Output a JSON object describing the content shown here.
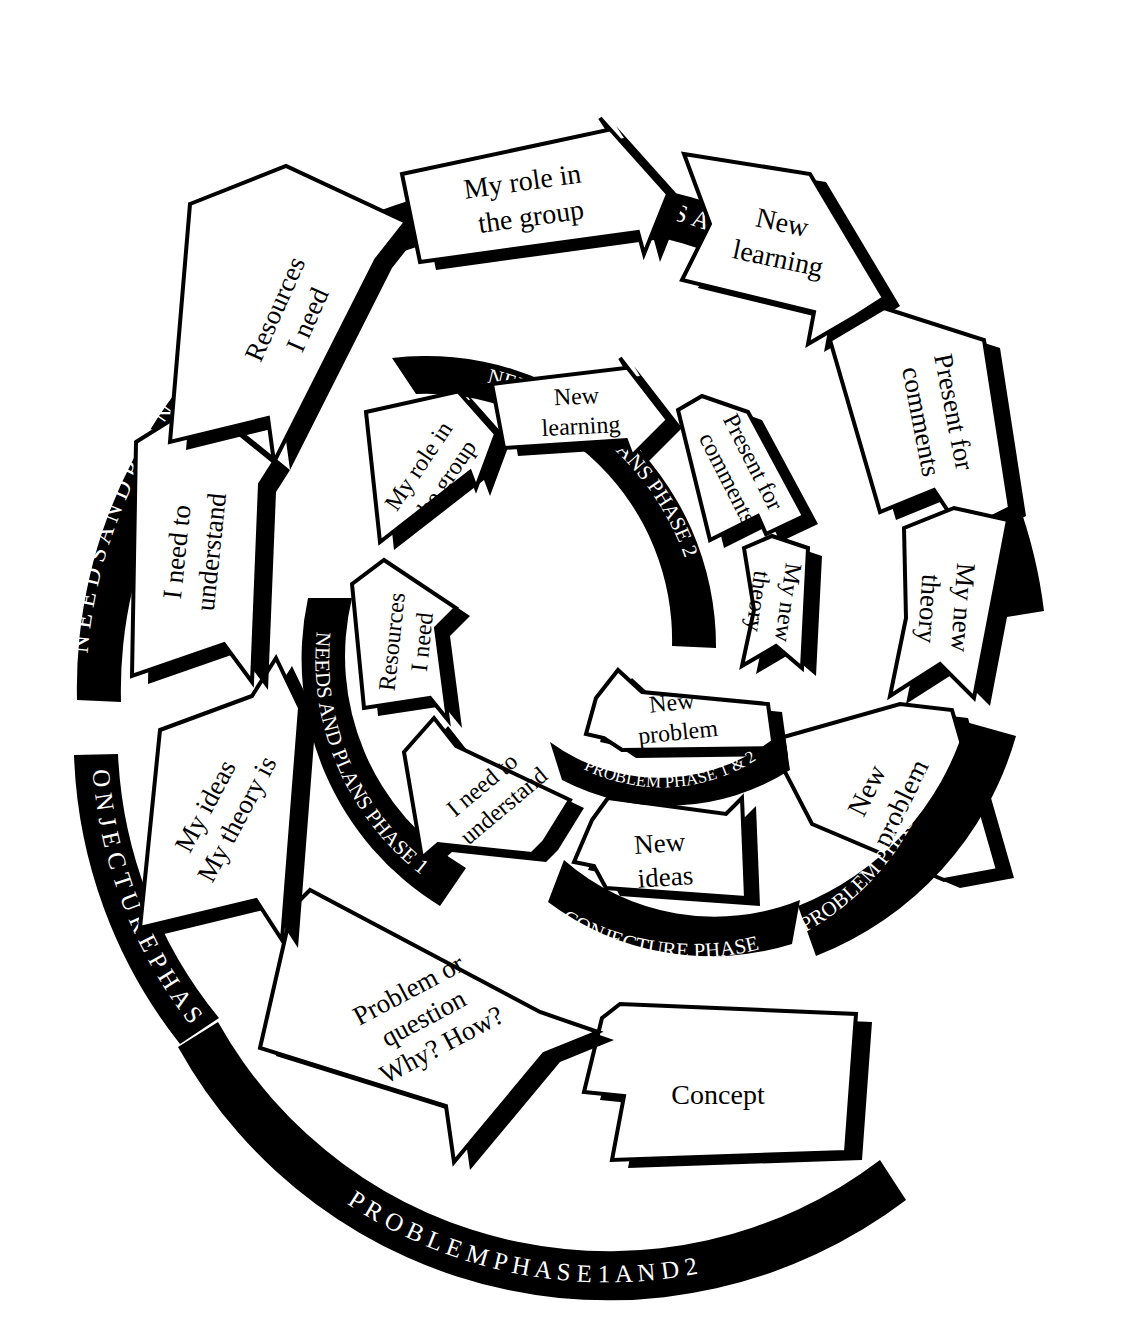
{
  "diagram": {
    "colors": {
      "ink": "#000000",
      "paper": "#ffffff",
      "band_text": "#ffffff"
    },
    "phase_bands": {
      "needs_phase_1": "N E E D S   A N D   P L A N S   P H A S E   1",
      "needs_phase_2": "N E E D S   A N D   P L A N S   P H A S E   2",
      "needs_phase_1_inner": "NEEDS AND PLANS PHASE 1",
      "needs_phase_2_inner": "NEEDS AND PLANS PHASE 2",
      "problem_phase_outer": "P R O B L E M   P H A S E   1   A N D   2",
      "problem_phase_mid": "PROBLEM PHASE 1 & 2",
      "problem_phase_inner": "PROBLEM PHASE 1 & 2",
      "conjecture_phase_outer": "C O N J E C T U R E   P H A S E",
      "conjecture_phase_mid": "CONJECTURE PHASE"
    },
    "outer_ring": {
      "name": "outer-spiral-ring",
      "steps": [
        {
          "id": "concept",
          "label": "Concept",
          "lines": [
            "Concept"
          ]
        },
        {
          "id": "problem-question",
          "label": "Problem or question Why? How?",
          "lines": [
            "Problem or",
            "question",
            "Why? How?"
          ]
        },
        {
          "id": "my-ideas-theory",
          "label": "My ideas My theory is",
          "lines": [
            "My ideas",
            "My theory is"
          ]
        },
        {
          "id": "i-need-understand",
          "label": "I need to understand",
          "lines": [
            "I need to",
            "understand"
          ]
        },
        {
          "id": "resources-i-need",
          "label": "Resources I need",
          "lines": [
            "Resources",
            "I need"
          ]
        },
        {
          "id": "my-role-group",
          "label": "My role in the group",
          "lines": [
            "My role in",
            "the group"
          ]
        },
        {
          "id": "new-learning",
          "label": "New learning",
          "lines": [
            "New",
            "learning"
          ]
        },
        {
          "id": "present-comments",
          "label": "Present for comments",
          "lines": [
            "Present for",
            "comments"
          ]
        },
        {
          "id": "my-new-theory",
          "label": "My new theory",
          "lines": [
            "My new",
            "theory"
          ]
        },
        {
          "id": "new-problem",
          "label": "New problem",
          "lines": [
            "New",
            "problem"
          ]
        }
      ]
    },
    "middle_ring": {
      "name": "middle-spiral-ring",
      "steps": [
        {
          "id": "new-ideas",
          "label": "New ideas",
          "lines": [
            "New",
            "ideas"
          ]
        },
        {
          "id": "i-need-understand",
          "label": "I need to understand",
          "lines": [
            "I need to",
            "understand"
          ]
        },
        {
          "id": "resources-i-need",
          "label": "Resources I need",
          "lines": [
            "Resources",
            "I need"
          ]
        },
        {
          "id": "my-role-group",
          "label": "My role in the group",
          "lines": [
            "My role in",
            "the group"
          ]
        },
        {
          "id": "new-learning",
          "label": "New learning",
          "lines": [
            "New",
            "learning"
          ]
        },
        {
          "id": "present-comments",
          "label": "Present for comments",
          "lines": [
            "Present for",
            "comments"
          ]
        },
        {
          "id": "my-new-theory",
          "label": "My new theory",
          "lines": [
            "My new",
            "theory"
          ]
        },
        {
          "id": "new-problem",
          "label": "New problem",
          "lines": [
            "New",
            "problem"
          ]
        }
      ]
    }
  }
}
